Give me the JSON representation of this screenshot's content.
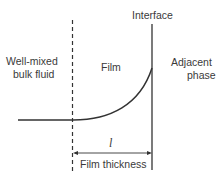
{
  "diagram": {
    "labels": {
      "interface": "Interface",
      "bulk_line1": "Well-mixed",
      "bulk_line2": "bulk fluid",
      "film": "Film",
      "adjacent_line1": "Adjacent",
      "adjacent_line2": "phase",
      "length_symbol": "l",
      "film_thickness": "Film thickness"
    },
    "colors": {
      "line": "#333333",
      "background": "#ffffff"
    }
  }
}
